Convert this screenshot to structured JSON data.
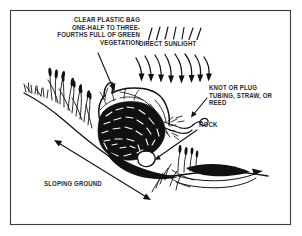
{
  "figure": {
    "border_color": "#3a3a44",
    "ink_color": "#111111",
    "text_color": "#2b2b2b",
    "background_color": "#ffffff"
  },
  "labels": {
    "bag": "CLEAR PLASTIC BAG\nONE-HALF TO THREE-\nFOURTHS FULL OF GREEN\nVEGETATION",
    "sunlight": "DIRECT SUNLIGHT",
    "knot": "KNOT OR PLUG\nTUBING, STRAW, OR\nREED",
    "rock": "ROCK",
    "slope": "SLOPING GROUND"
  },
  "elements": {
    "bag_leader_arrow": "leader-arrow",
    "knot_leader_arrow": "leader-arrow",
    "rock_leader_arrow": "leader-arrow",
    "slope_double_arrow": "double-headed-arrow",
    "sun_rays": "sunlight-ray-arrows",
    "vegetation": "green-vegetation-mass",
    "grass": "grass-tufts",
    "rock_shape": "rock",
    "tubing": "tubing-straw-reed",
    "ground_line": "sloping-ground-line"
  }
}
